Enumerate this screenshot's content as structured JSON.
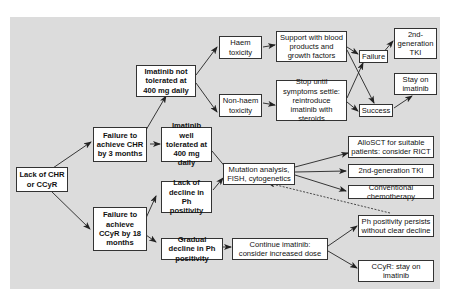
{
  "diagram": {
    "nodes": {
      "lack_chr_ccyr": "Lack of CHR or CCyR",
      "fail_chr_3m": "Failure to achieve CHR by 3 months",
      "fail_ccyr_18m": "Failure to achieve CCyR by 18 months",
      "imatinib_not_tolerated": "Imatinib not tolerated at 400 mg daily",
      "imatinib_well_tolerated": "Imatinib well tolerated at 400 mg daily",
      "lack_decline_ph": "Lack of decline in Ph positivity",
      "gradual_decline_ph": "Gradual decline in Ph positivity",
      "haem_toxicity": "Haem toxicity",
      "non_haem_toxicity": "Non-haem toxicity",
      "support_blood": "Support with blood products and growth factors",
      "stop_until": "Stop until symptoms settle: reintroduce imatinib with steroids",
      "failure": "Failure",
      "success": "Success",
      "second_gen_tki_top": "2nd-generation TKI",
      "stay_on_imatinib": "Stay on imatinib",
      "mutation_analysis": "Mutation analysis, FISH, cytogenetics",
      "allosct": "AlloSCT for suitable patients: consider RICT",
      "second_gen_tki": "2nd-generation TKI",
      "conventional_chemo": "Conventional chemotherapy",
      "continue_imatinib": "Continue imatinib: consider increased dose",
      "ph_persists": "Ph positivity persists without clear decline",
      "ccyr_stay": "CCyR: stay on imatinib"
    },
    "colors": {
      "panel_bg": "#dcdcdc",
      "box_bg": "#ffffff",
      "border": "#333333",
      "arrow": "#222222"
    }
  }
}
